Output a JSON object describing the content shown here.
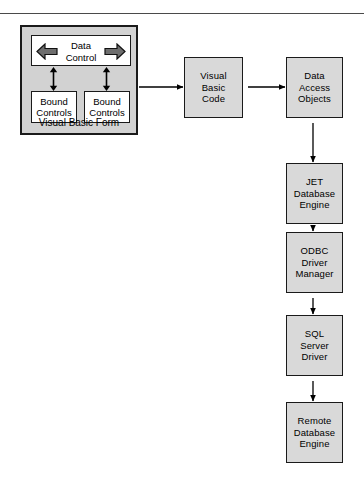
{
  "figure": {
    "type": "flow-diagram",
    "title_rule": true
  },
  "vb_form": {
    "caption": "Visual Basic Form",
    "data_control": {
      "label": "Data\nControl",
      "label_line1": "Data",
      "label_line2": "Control",
      "arrow_left": "left-block-arrow",
      "arrow_right": "right-block-arrow"
    },
    "bound_controls": [
      {
        "label_line1": "Bound",
        "label_line2": "Controls"
      },
      {
        "label_line1": "Bound",
        "label_line2": "Controls"
      }
    ]
  },
  "nodes": [
    {
      "id": "visual-basic-code",
      "lines": [
        "Visual",
        "Basic",
        "Code"
      ]
    },
    {
      "id": "data-access-objects",
      "lines": [
        "Data",
        "Access",
        "Objects"
      ]
    },
    {
      "id": "jet-database-engine",
      "lines": [
        "JET",
        "Database",
        "Engine"
      ]
    },
    {
      "id": "odbc-driver-manager",
      "lines": [
        "ODBC",
        "Driver",
        "Manager"
      ]
    },
    {
      "id": "sql-server-driver",
      "lines": [
        "SQL",
        "Server",
        "Driver"
      ]
    },
    {
      "id": "remote-database-engine",
      "lines": [
        "Remote",
        "Database",
        "Engine"
      ]
    }
  ],
  "flow": [
    {
      "from": "visual-basic-form",
      "to": "visual-basic-code",
      "direction": "right"
    },
    {
      "from": "visual-basic-code",
      "to": "data-access-objects",
      "direction": "right"
    },
    {
      "from": "data-access-objects",
      "to": "jet-database-engine",
      "direction": "down"
    },
    {
      "from": "jet-database-engine",
      "to": "odbc-driver-manager",
      "direction": "down"
    },
    {
      "from": "odbc-driver-manager",
      "to": "sql-server-driver",
      "direction": "down"
    },
    {
      "from": "sql-server-driver",
      "to": "remote-database-engine",
      "direction": "down"
    }
  ],
  "colors": {
    "node_fill": "#d9d9d9",
    "node_border": "#1a1a1a",
    "shadow": "#4f4f4f",
    "form_fill": "#d2d2d2",
    "inner_fill": "#ffffff",
    "arrow_fill": "#6e6e6e",
    "line": "#000000",
    "rule": "#4a4a4a"
  }
}
